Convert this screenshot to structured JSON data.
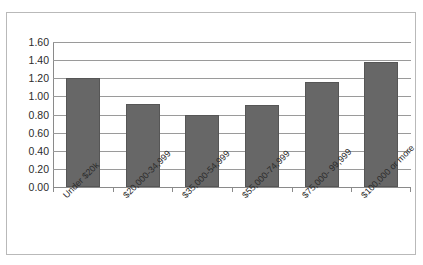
{
  "chart_data": {
    "type": "bar",
    "title": "",
    "xlabel": "",
    "ylabel": "",
    "categories": [
      "Under $20k",
      "$20,000-34,999",
      "$35,000-54,999",
      "$55,000-74,999",
      "$75,000- 99,999",
      "$100,000 or more"
    ],
    "values": [
      1.2,
      0.92,
      0.79,
      0.91,
      1.16,
      1.38
    ],
    "ylim": [
      0.0,
      1.6
    ],
    "ytick_step": 0.2,
    "ytick_labels": [
      "0.00",
      "0.20",
      "0.40",
      "0.60",
      "0.80",
      "1.00",
      "1.20",
      "1.40",
      "1.60"
    ],
    "ytick_values": [
      0.0,
      0.2,
      0.4,
      0.6,
      0.8,
      1.0,
      1.2,
      1.4,
      1.6
    ],
    "grid": true,
    "legend": false,
    "series": [
      {
        "name": "",
        "values": [
          1.2,
          0.92,
          0.79,
          0.91,
          1.16,
          1.38
        ]
      }
    ],
    "colors": {
      "bar_fill": "#676767",
      "bar_border": "#565656",
      "gridline": "#9a9a9a",
      "axis": "#8a8a8a",
      "frame_border": "#b9b9b9",
      "text": "#2b2b2b",
      "background": "#ffffff"
    }
  }
}
